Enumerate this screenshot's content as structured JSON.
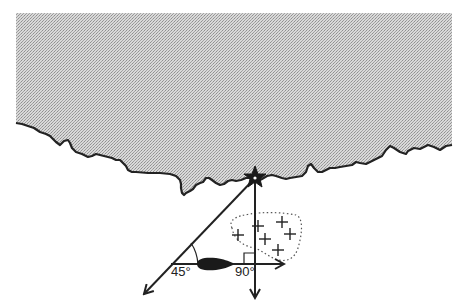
{
  "diagram": {
    "type": "navigation-bearing-diagram",
    "title_fragment": "",
    "colors": {
      "land_fill": "#cfcfcf",
      "land_dots": "#9a9a9a",
      "line": "#222222",
      "ship": "#1a1a1a",
      "background": "#ffffff"
    },
    "labels": {
      "angle_1": "45°",
      "angle_2": "90°"
    },
    "elements": {
      "landmark": "star-landmark",
      "vessel": "ship",
      "region": "dotted-area-with-crosses",
      "cross_count": 6
    }
  }
}
